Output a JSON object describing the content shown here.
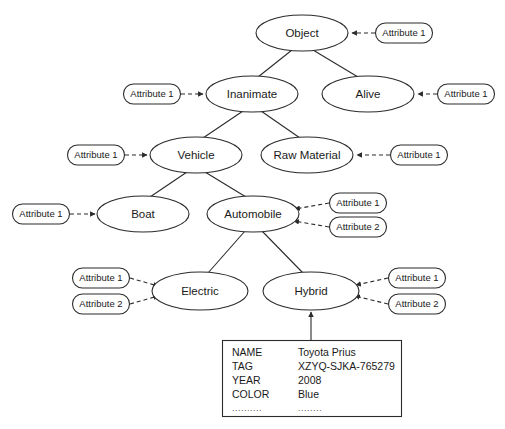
{
  "diagram": {
    "type": "er-specialization-hierarchy",
    "colors": {
      "background": "#ffffff",
      "stroke": "#2b2b2b",
      "text": "#1a1a1a",
      "shape_fill": "#ffffff"
    },
    "entities": [
      {
        "id": "object",
        "label": "Object",
        "cx": 302,
        "cy": 33,
        "rx": 46,
        "ry": 18
      },
      {
        "id": "inanimate",
        "label": "Inanimate",
        "cx": 252,
        "cy": 94,
        "rx": 46,
        "ry": 18
      },
      {
        "id": "alive",
        "label": "Alive",
        "cx": 368,
        "cy": 94,
        "rx": 46,
        "ry": 18
      },
      {
        "id": "vehicle",
        "label": "Vehicle",
        "cx": 196,
        "cy": 155,
        "rx": 46,
        "ry": 18
      },
      {
        "id": "raw_material",
        "label": "Raw Material",
        "cx": 307,
        "cy": 155,
        "rx": 46,
        "ry": 18
      },
      {
        "id": "boat",
        "label": "Boat",
        "cx": 143,
        "cy": 214,
        "rx": 46,
        "ry": 18
      },
      {
        "id": "automobile",
        "label": "Automobile",
        "cx": 253,
        "cy": 214,
        "rx": 46,
        "ry": 18
      },
      {
        "id": "electric",
        "label": "Electric",
        "cx": 200,
        "cy": 291,
        "rx": 48,
        "ry": 19
      },
      {
        "id": "hybrid",
        "label": "Hybrid",
        "cx": 311,
        "cy": 291,
        "rx": 48,
        "ry": 19
      }
    ],
    "attributes": [
      {
        "id": "attr-object-1",
        "label": "Attribute 1",
        "cx": 404,
        "cy": 33,
        "w": 57,
        "h": 20,
        "target": "object",
        "side": "right"
      },
      {
        "id": "attr-inanimate-1",
        "label": "Attribute 1",
        "cx": 152,
        "cy": 94,
        "w": 57,
        "h": 20,
        "target": "inanimate",
        "side": "left"
      },
      {
        "id": "attr-alive-1",
        "label": "Attribute 1",
        "cx": 466,
        "cy": 94,
        "w": 57,
        "h": 20,
        "target": "alive",
        "side": "right"
      },
      {
        "id": "attr-vehicle-1",
        "label": "Attribute 1",
        "cx": 96,
        "cy": 155,
        "w": 57,
        "h": 20,
        "target": "vehicle",
        "side": "left"
      },
      {
        "id": "attr-rawmat-1",
        "label": "Attribute 1",
        "cx": 419,
        "cy": 155,
        "w": 57,
        "h": 20,
        "target": "raw_material",
        "side": "right"
      },
      {
        "id": "attr-boat-1",
        "label": "Attribute 1",
        "cx": 41,
        "cy": 214,
        "w": 57,
        "h": 20,
        "target": "boat",
        "side": "left"
      },
      {
        "id": "attr-automobile-1",
        "label": "Attribute 1",
        "cx": 358,
        "cy": 203,
        "w": 57,
        "h": 20,
        "target": "automobile",
        "side": "right"
      },
      {
        "id": "attr-automobile-2",
        "label": "Attribute 2",
        "cx": 358,
        "cy": 227,
        "w": 57,
        "h": 20,
        "target": "automobile",
        "side": "right"
      },
      {
        "id": "attr-electric-1",
        "label": "Attribute 1",
        "cx": 101,
        "cy": 278,
        "w": 57,
        "h": 20,
        "target": "electric",
        "side": "left"
      },
      {
        "id": "attr-electric-2",
        "label": "Attribute 2",
        "cx": 101,
        "cy": 304,
        "w": 57,
        "h": 20,
        "target": "electric",
        "side": "left"
      },
      {
        "id": "attr-hybrid-1",
        "label": "Attribute 1",
        "cx": 417,
        "cy": 278,
        "w": 57,
        "h": 20,
        "target": "hybrid",
        "side": "right"
      },
      {
        "id": "attr-hybrid-2",
        "label": "Attribute 2",
        "cx": 417,
        "cy": 304,
        "w": 57,
        "h": 20,
        "target": "hybrid",
        "side": "right"
      }
    ],
    "hierarchy_links": [
      {
        "from": "object",
        "to": "inanimate"
      },
      {
        "from": "object",
        "to": "alive"
      },
      {
        "from": "inanimate",
        "to": "vehicle"
      },
      {
        "from": "inanimate",
        "to": "raw_material"
      },
      {
        "from": "vehicle",
        "to": "boat"
      },
      {
        "from": "vehicle",
        "to": "automobile"
      },
      {
        "from": "automobile",
        "to": "electric"
      },
      {
        "from": "automobile",
        "to": "hybrid"
      }
    ],
    "instance_link": {
      "from": "instance_table",
      "to": "hybrid"
    }
  },
  "instance_table": {
    "box": {
      "x": 222,
      "y": 340,
      "w": 179,
      "h": 76
    },
    "key_x": 232,
    "value_x": 298,
    "rows": [
      {
        "key": "NAME",
        "value": "Toyota Prius"
      },
      {
        "key": "TAG",
        "value": "XZYQ-SJKA-765279"
      },
      {
        "key": "YEAR",
        "value": "2008"
      },
      {
        "key": "COLOR",
        "value": "Blue"
      }
    ],
    "continuation": {
      "key": "..........",
      "value": "........"
    }
  }
}
